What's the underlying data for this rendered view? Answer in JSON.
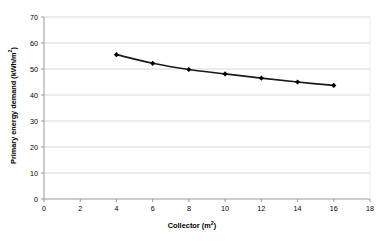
{
  "chart_data": {
    "type": "line",
    "title": "",
    "subtitle": "",
    "xlabel": "Collector (m²)",
    "ylabel": "Primary energy demand (kWh/m²)",
    "x": [
      4,
      6,
      8,
      10,
      12,
      14,
      16
    ],
    "values": [
      55.5,
      52.2,
      49.8,
      48.1,
      46.5,
      45.0,
      43.7
    ],
    "series": [
      {
        "name": "Primary energy demand",
        "x": [
          4,
          6,
          8,
          10,
          12,
          14,
          16
        ],
        "values": [
          55.5,
          52.2,
          49.8,
          48.1,
          46.5,
          45.0,
          43.7
        ]
      }
    ],
    "xlim": [
      0,
      18
    ],
    "ylim": [
      0,
      70
    ],
    "xticks": [
      0,
      2,
      4,
      6,
      8,
      10,
      12,
      14,
      16,
      18
    ],
    "yticks": [
      0,
      10,
      20,
      30,
      40,
      50,
      60,
      70
    ],
    "xtick_labels": [
      "0",
      "2",
      "4",
      "6",
      "8",
      "10",
      "12",
      "14",
      "16",
      "18"
    ],
    "ytick_labels": [
      "0",
      "10",
      "20",
      "30",
      "40",
      "50",
      "60",
      "70"
    ],
    "grid": "horizontal",
    "legend": "none",
    "marker": "diamond",
    "line_color": "#1a1a1a",
    "marker_color": "#000000",
    "grid_color": "#d9d9d9",
    "axis_color": "#9a9a9a",
    "plot_background": "#ffffff",
    "annotations": []
  },
  "artifact": {
    "top_clipped_text": "· ··· ··"
  }
}
